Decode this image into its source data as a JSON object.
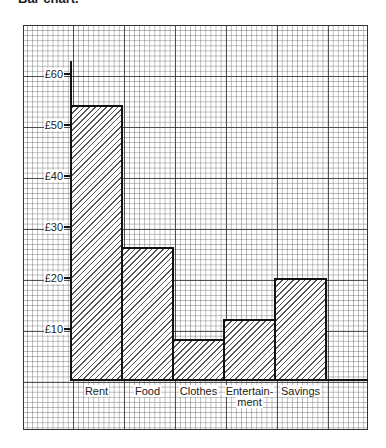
{
  "title": "Bar chart.",
  "chart_data": {
    "type": "bar",
    "title": "Bar chart.",
    "xlabel": "",
    "ylabel": "",
    "categories": [
      "Rent",
      "Food",
      "Clothes",
      "Entertain-\nment",
      "Savings"
    ],
    "category_display": [
      "Rent",
      "Food",
      "Clothes",
      "Entertain-",
      "Savings"
    ],
    "category_display_line2": [
      "",
      "",
      "",
      "ment",
      ""
    ],
    "values": [
      54,
      26,
      8,
      12,
      20
    ],
    "ylim": [
      0,
      65
    ],
    "yticks": [
      10,
      20,
      30,
      40,
      50,
      60
    ],
    "ytick_labels": [
      "£10",
      "£20",
      "£30",
      "£40",
      "£50",
      "£60"
    ],
    "grid": true,
    "bar_fill": "diagonal-hatch",
    "legend": null
  }
}
